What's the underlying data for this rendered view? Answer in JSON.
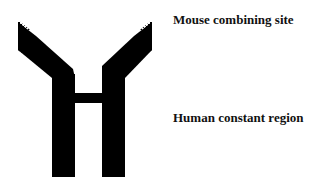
{
  "diagram": {
    "labels": {
      "mouse": "Mouse combining site",
      "human": "Human constant region"
    },
    "colors": {
      "background": "#ffffff",
      "constant_region": "#000000",
      "text": "#111111"
    },
    "parts": [
      {
        "name": "left-arm",
        "type": "mouse-variable",
        "pattern": "checkered-tip"
      },
      {
        "name": "right-arm",
        "type": "mouse-variable",
        "pattern": "checkered-tip"
      },
      {
        "name": "left-heavy-chain",
        "type": "human-constant"
      },
      {
        "name": "right-heavy-chain",
        "type": "human-constant"
      },
      {
        "name": "hinge-crossbar",
        "type": "human-constant"
      }
    ]
  }
}
